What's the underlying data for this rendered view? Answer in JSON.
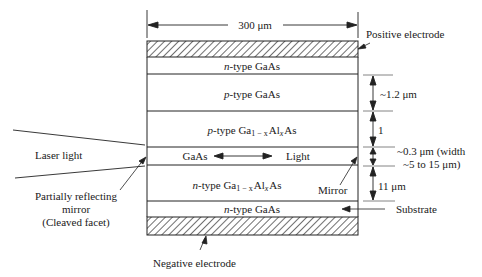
{
  "diagram": {
    "width_dimension": "300 μm",
    "layers": [
      {
        "id": "positive-electrode",
        "label": "",
        "hatched": true
      },
      {
        "id": "n-gaas-top",
        "prefix": "n",
        "label": "-type GaAs"
      },
      {
        "id": "p-gaas",
        "prefix": "p",
        "label": "-type GaAs"
      },
      {
        "id": "p-gaalas",
        "prefix": "p",
        "label": "-type Ga",
        "sub1": "1 − x",
        "mid": "Al",
        "sub2": "x",
        "suffix": "As"
      },
      {
        "id": "active-gaas",
        "label": "GaAs",
        "light_label": "Light"
      },
      {
        "id": "n-gaalas",
        "prefix": "n",
        "label": "-type Ga",
        "sub1": "1 − x",
        "mid": "Al",
        "sub2": "x",
        "suffix": "As"
      },
      {
        "id": "n-gaas-substrate",
        "prefix": "n",
        "label": "-type GaAs"
      },
      {
        "id": "negative-electrode",
        "label": "",
        "hatched": true
      }
    ],
    "annotations": {
      "positive_electrode": "Positive electrode",
      "negative_electrode": "Negative electrode",
      "substrate": "Substrate",
      "mirror": "Mirror",
      "laser_light": "Laser light",
      "partial_mirror_line1": "Partially reflecting",
      "partial_mirror_line2": "mirror",
      "partial_mirror_line3": "(Cleaved facet)"
    },
    "thickness_dimensions": {
      "p_gaas": "~1.2 μm",
      "p_gaalas": "1",
      "active_line1": "~0.3 μm (width",
      "active_line2": "~5 to 15 μm)",
      "n_gaalas": "11 μm"
    }
  }
}
